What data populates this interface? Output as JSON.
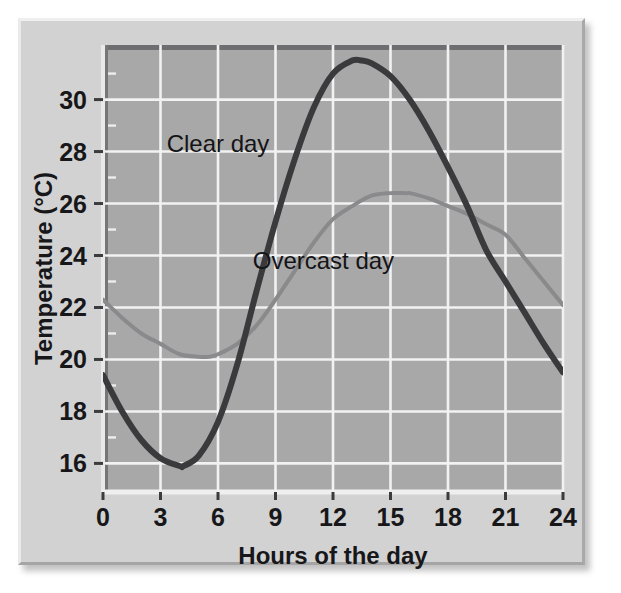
{
  "figure": {
    "panel_background": "#d2d2d2",
    "plot_background": "#a8a8a8",
    "gridline_color": "#f2f2f2",
    "axis_color": "#5a5a5a"
  },
  "chart_data": {
    "type": "line",
    "title": "",
    "subtitle": "",
    "xlabel": "Hours of the day",
    "ylabel": "Temperature (°C)",
    "xlim": [
      0,
      24
    ],
    "ylim": [
      14.9,
      32.1
    ],
    "xticks": [
      0,
      3,
      6,
      9,
      12,
      15,
      18,
      21,
      24
    ],
    "xtick_labels": [
      "0",
      "3",
      "6",
      "9",
      "12",
      "15",
      "18",
      "21",
      "24"
    ],
    "yticks": [
      16,
      18,
      20,
      22,
      24,
      26,
      28,
      30
    ],
    "ytick_labels": [
      "16",
      "18",
      "20",
      "22",
      "24",
      "26",
      "28",
      "30"
    ],
    "yminor_ticks": [
      17,
      19,
      21,
      23,
      25,
      27,
      29,
      31
    ],
    "grid": true,
    "legend_position": "inline-annotation",
    "series": [
      {
        "name": "Clear day",
        "color": "#3a3a3c",
        "line_width": 6,
        "label_x": 6.0,
        "label_y": 28.0,
        "x": [
          0,
          1,
          2,
          3,
          4,
          4.2,
          5,
          6,
          7,
          8,
          9,
          10,
          11,
          12,
          13,
          13.5,
          14,
          15,
          16,
          17,
          18,
          19,
          20,
          21,
          22,
          23,
          24
        ],
        "values": [
          19.4,
          18.0,
          16.9,
          16.2,
          15.9,
          15.9,
          16.3,
          17.6,
          19.8,
          22.6,
          25.3,
          27.7,
          29.7,
          31.0,
          31.5,
          31.5,
          31.4,
          30.9,
          30.0,
          28.8,
          27.4,
          25.9,
          24.2,
          23.0,
          21.8,
          20.6,
          19.5
        ]
      },
      {
        "name": "Overcast day",
        "color": "#8a8a8c",
        "line_width": 4,
        "label_x": 11.5,
        "label_y": 23.5,
        "x": [
          0,
          1,
          2,
          3,
          4,
          5,
          5.5,
          6,
          7,
          8,
          9,
          10,
          11,
          12,
          13,
          14,
          15,
          15.8,
          16,
          17,
          18,
          19,
          20,
          21,
          22,
          23,
          24
        ],
        "values": [
          22.3,
          21.6,
          21.0,
          20.6,
          20.2,
          20.1,
          20.1,
          20.2,
          20.6,
          21.3,
          22.3,
          23.4,
          24.5,
          25.4,
          25.9,
          26.3,
          26.4,
          26.4,
          26.4,
          26.2,
          25.9,
          25.6,
          25.2,
          24.8,
          23.9,
          23.0,
          22.1
        ]
      }
    ],
    "annotations": [
      {
        "text": "Clear day",
        "x": 6.0,
        "y": 28.0
      },
      {
        "text": "Overcast day",
        "x": 11.5,
        "y": 23.5
      }
    ]
  }
}
